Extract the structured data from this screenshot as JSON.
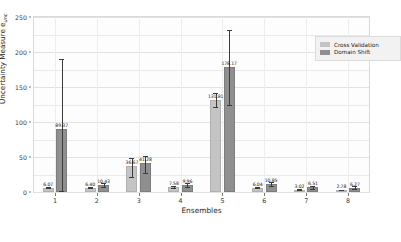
{
  "chart_data": {
    "type": "bar",
    "title": "",
    "xlabel": "Ensembles",
    "ylabel": "Uncertainty Measure e",
    "ylabel_subscript": "unc",
    "categories": [
      "1",
      "2",
      "3",
      "4",
      "5",
      "6",
      "7",
      "8"
    ],
    "ylim": [
      0,
      250
    ],
    "yticks": [
      0,
      50,
      100,
      150,
      200,
      250
    ],
    "grid": true,
    "legend_position": "top-right",
    "series": [
      {
        "name": "Cross Validation",
        "color": "#c4c4c4",
        "values": [
          6.07,
          6.4,
          36.67,
          7.58,
          131.81,
          6.04,
          3.02,
          2.78
        ],
        "labels": [
          "6.07",
          "6.40",
          "36.67",
          "7.58",
          "131.81",
          "6.04",
          "3.02",
          "2.78"
        ],
        "err_low": [
          5.2,
          5.4,
          22.0,
          6.4,
          122.0,
          5.2,
          2.5,
          2.3
        ],
        "err_high": [
          7.0,
          7.5,
          48.0,
          8.8,
          141.0,
          7.0,
          3.6,
          3.3
        ]
      },
      {
        "name": "Domain Shift",
        "color": "#8f8f8f",
        "values": [
          89.37,
          10.43,
          41.28,
          9.96,
          178.17,
          10.85,
          6.51,
          6.27
        ],
        "labels": [
          "89.37",
          "10.43",
          "41.28",
          "9.96",
          "178.17",
          "10.85",
          "6.51",
          "6.27"
        ],
        "err_low": [
          2.0,
          7.8,
          27.5,
          7.2,
          124.0,
          7.9,
          4.6,
          4.3
        ],
        "err_high": [
          190.0,
          13.2,
          52.0,
          12.6,
          232.0,
          14.0,
          8.6,
          8.4
        ]
      }
    ]
  },
  "legend": {
    "items": [
      {
        "label": "Cross Validation",
        "color": "#c4c4c4"
      },
      {
        "label": "Domain Shift",
        "color": "#8f8f8f"
      }
    ]
  }
}
